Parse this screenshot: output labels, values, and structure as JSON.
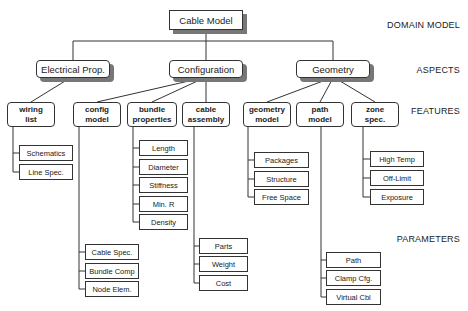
{
  "root": {
    "label": "Cable Model"
  },
  "levels": {
    "domain": "DOMAIN MODEL",
    "aspects": "ASPECTS",
    "features": "FEATURES",
    "parameters": "PARAMETERS"
  },
  "aspects": [
    {
      "label": "Electrical Prop."
    },
    {
      "label": "Configuration"
    },
    {
      "label": "Geometry"
    }
  ],
  "features": [
    {
      "line1": "wiring",
      "line2": "list",
      "aspect": "Electrical Prop.",
      "params": [
        "Schematics",
        "Line Spec."
      ]
    },
    {
      "line1": "config",
      "line2": "model",
      "aspect": "Configuration",
      "params": [
        "Cable Spec.",
        "Bundle Comp",
        "Node Elem."
      ]
    },
    {
      "line1": "bundle",
      "line2": "properties",
      "aspect": "Configuration",
      "params": [
        "Length",
        "Diameter",
        "Stiffness",
        "Min. R",
        "Density"
      ]
    },
    {
      "line1": "cable",
      "line2": "assembly",
      "aspect": "Configuration",
      "params": [
        "Parts",
        "Weight",
        "Cost"
      ]
    },
    {
      "line1": "geometry",
      "line2": "model",
      "aspect": "Geometry",
      "params": [
        "Packages",
        "Structure",
        "Free Space"
      ]
    },
    {
      "line1": "path",
      "line2": "model",
      "aspect": "Geometry",
      "params": [
        "Path",
        "Clamp Cfg.",
        "Virtual Cbl"
      ]
    },
    {
      "line1": "zone",
      "line2": "spec.",
      "aspect": "Geometry",
      "params": [
        "High Temp",
        "Off-Limit",
        "Exposure"
      ]
    }
  ]
}
